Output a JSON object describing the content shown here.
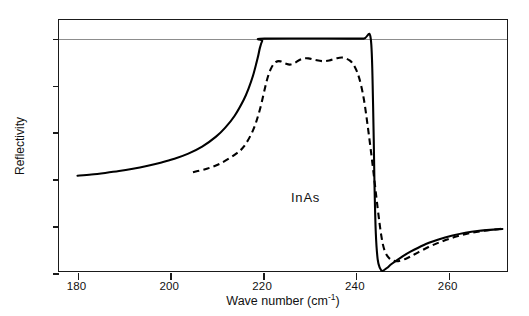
{
  "chart_data": {
    "type": "line",
    "title": "",
    "xlabel": "Wave number (cm",
    "xlabel_sup": "-1",
    "xlabel_close": ")",
    "ylabel": "Reflectivity",
    "annotation": "InAs",
    "xlim": [
      176,
      273
    ],
    "ylim": [
      0,
      1.08
    ],
    "grid": "horizontal-line-at-1",
    "gridline_value": 1,
    "legend": "none",
    "xticks": [
      180,
      200,
      220,
      240,
      260
    ],
    "xtick_labels": [
      "180",
      "200",
      "220",
      "240",
      "260"
    ],
    "yticks": [
      0,
      0.2,
      0.4,
      0.6,
      0.8,
      1
    ],
    "ytick_labels": [
      "0",
      "0,2",
      "0,4",
      "0,6",
      "0,8",
      "1"
    ],
    "series": [
      {
        "name": "theoretical-reflectivity-solid",
        "style": "solid",
        "color": "#000000",
        "x": [
          180,
          183,
          186,
          189,
          192,
          195,
          198,
          201,
          204,
          207,
          210,
          212,
          214,
          216,
          217,
          218,
          219,
          219.5,
          220,
          220.5,
          238.5,
          242,
          243.5,
          244,
          244.3,
          244.6,
          245,
          245.5,
          246,
          247,
          248,
          250,
          252,
          255,
          258,
          261,
          264,
          267,
          270,
          272
        ],
        "y": [
          0.41,
          0.415,
          0.422,
          0.43,
          0.44,
          0.452,
          0.466,
          0.483,
          0.505,
          0.535,
          0.578,
          0.617,
          0.667,
          0.737,
          0.783,
          0.84,
          0.915,
          0.96,
          0.99,
          1.0,
          1.0,
          1.0,
          1.0,
          0.72,
          0.38,
          0.16,
          0.05,
          0.012,
          0.0,
          0.013,
          0.03,
          0.058,
          0.082,
          0.112,
          0.134,
          0.152,
          0.165,
          0.173,
          0.178,
          0.181
        ]
      },
      {
        "name": "experimental-reflectivity-dashed",
        "style": "dashed",
        "color": "#000000",
        "x": [
          205,
          208,
          211,
          214,
          216,
          218,
          219.5,
          221,
          222,
          223,
          224,
          225,
          226,
          227,
          228.5,
          230,
          231.5,
          233,
          234.5,
          236,
          237.5,
          239,
          240,
          241,
          242,
          243,
          244,
          245,
          245.8,
          246.5,
          247.5,
          249,
          251,
          253,
          256,
          259,
          262,
          265,
          268,
          271,
          272
        ],
        "y": [
          0.425,
          0.44,
          0.463,
          0.5,
          0.535,
          0.605,
          0.695,
          0.82,
          0.875,
          0.9,
          0.902,
          0.893,
          0.888,
          0.895,
          0.912,
          0.915,
          0.908,
          0.903,
          0.906,
          0.915,
          0.918,
          0.905,
          0.88,
          0.83,
          0.74,
          0.6,
          0.44,
          0.27,
          0.15,
          0.088,
          0.055,
          0.042,
          0.052,
          0.072,
          0.103,
          0.128,
          0.148,
          0.163,
          0.173,
          0.18,
          0.183
        ]
      }
    ]
  }
}
